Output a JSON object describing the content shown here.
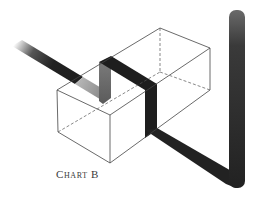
{
  "figure": {
    "caption": "Chart B",
    "colors": {
      "band": "#1e1e1e",
      "band_light": "#d8d8d8",
      "edge": "#444444",
      "background": "#ffffff"
    }
  }
}
